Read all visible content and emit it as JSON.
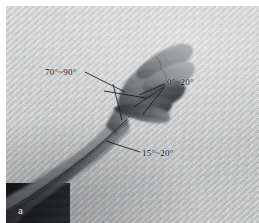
{
  "figure": {
    "panel_letter": "a"
  },
  "annotations": [
    {
      "id": "wrist-extension",
      "text": "70°~90°",
      "name": "annotation-wrist-extension"
    },
    {
      "id": "finger-flexion",
      "text": "0°~20°",
      "name": "annotation-finger-flexion"
    },
    {
      "id": "ulnar-deviation",
      "text": "15°~20°",
      "name": "annotation-ulnar-deviation"
    }
  ],
  "colors": {
    "background": "#c9cacb",
    "backdrop_light": "#d6d7d8",
    "backdrop_dark": "#bfc0c1",
    "limb_dark": "#2b2c2e",
    "limb_mid": "#5d5f62",
    "limb_light": "#9fa1a4",
    "annotation_text": "#1b1c1e",
    "panel_letter": "#e8e9ea",
    "leader_line": "#141517",
    "page": "#ffffff"
  }
}
